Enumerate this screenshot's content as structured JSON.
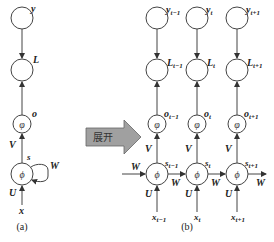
{
  "diagram": {
    "folded": {
      "caption": "(a)",
      "nodes": {
        "y": "y",
        "L": "L",
        "o": "o",
        "o_glyph": "φ",
        "s": "s",
        "s_glyph": "ϕ",
        "x": "x"
      },
      "edges": {
        "V": "V",
        "U": "U",
        "W": "W"
      }
    },
    "unfold_arrow": {
      "label": "展开",
      "color": "#9a9a9a"
    },
    "unfolded": {
      "caption": "(b)",
      "columns": [
        {
          "y": "y",
          "y_sub": "t−1",
          "L": "L",
          "L_sub": "t−1",
          "o": "o",
          "o_sub": "t−1",
          "s": "s",
          "s_sub": "t−1",
          "x": "x",
          "x_sub": "t−1",
          "V": "V",
          "U": "U",
          "o_glyph": "φ",
          "s_glyph": "ϕ"
        },
        {
          "y": "y",
          "y_sub": "t",
          "L": "L",
          "L_sub": "t",
          "o": "o",
          "o_sub": "t",
          "s": "s",
          "s_sub": "t",
          "x": "x",
          "x_sub": "t",
          "V": "V",
          "U": "U",
          "o_glyph": "φ",
          "s_glyph": "ϕ"
        },
        {
          "y": "y",
          "y_sub": "t+1",
          "L": "L",
          "L_sub": "t+1",
          "o": "o",
          "o_sub": "t+1",
          "s": "s",
          "s_sub": "t+1",
          "x": "x",
          "x_sub": "t+1",
          "V": "V",
          "U": "U",
          "o_glyph": "φ",
          "s_glyph": "ϕ"
        }
      ],
      "recurrent_edges": [
        "W",
        "W",
        "W",
        "W"
      ]
    }
  }
}
